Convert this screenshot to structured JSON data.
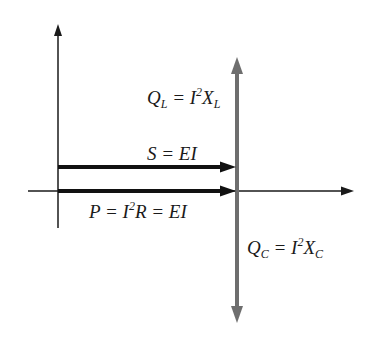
{
  "diagram": {
    "colors": {
      "axis": "#1a1a1a",
      "power_arrow": "#111111",
      "reactive_arrow": "#6e6e6e",
      "text": "#1a1a1a"
    },
    "labels": {
      "ql": {
        "sym": "Q",
        "sub": "L",
        "eq": " = I",
        "sup": "2",
        "x": "X",
        "xsub": "L"
      },
      "s": {
        "text": "S = EI"
      },
      "p": {
        "pre": "P = I",
        "sup": "2",
        "post": "R = EI"
      },
      "qc": {
        "sym": "Q",
        "sub": "C",
        "eq": " = I",
        "sup": "2",
        "x": "X",
        "xsub": "C"
      }
    },
    "arrows": [
      {
        "name": "apparent-power-S",
        "from": [
          58,
          167
        ],
        "to": [
          236,
          167
        ]
      },
      {
        "name": "real-power-P",
        "from": [
          58,
          191
        ],
        "to": [
          236,
          191
        ]
      },
      {
        "name": "reactive-power-QL",
        "from": [
          237,
          191
        ],
        "to": [
          237,
          58
        ]
      },
      {
        "name": "reactive-power-QC",
        "from": [
          237,
          191
        ],
        "to": [
          237,
          322
        ]
      }
    ]
  }
}
